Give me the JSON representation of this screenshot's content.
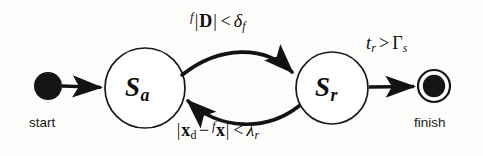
{
  "diagram": {
    "type": "finite-state-machine",
    "title": "",
    "stroke_color": "#131212",
    "fill_color": "#ffffff",
    "background": "#fdfdfc",
    "nodes": [
      {
        "id": "start",
        "kind": "initial-node",
        "label": "start",
        "symbol": "",
        "cx": 48,
        "cy": 86,
        "r": 14
      },
      {
        "id": "s_a",
        "kind": "state",
        "label": "",
        "symbol_base": "S",
        "symbol_sub": "a",
        "cx": 145,
        "cy": 88,
        "r": 40
      },
      {
        "id": "s_r",
        "kind": "state",
        "label": "",
        "symbol_base": "S",
        "symbol_sub": "r",
        "cx": 332,
        "cy": 88,
        "r": 36
      },
      {
        "id": "finish",
        "kind": "final-node",
        "label": "finish",
        "symbol": "",
        "cx": 434,
        "cy": 86,
        "r": 16
      }
    ],
    "edges": [
      {
        "id": "start-to-sa",
        "from": "start",
        "to": "s_a",
        "shape": "straight",
        "label": ""
      },
      {
        "id": "sa-to-sr",
        "from": "s_a",
        "to": "s_r",
        "shape": "arc-upper",
        "label_plain": "f|D| < delta_f"
      },
      {
        "id": "sr-to-sa",
        "from": "s_r",
        "to": "s_a",
        "shape": "arc-lower",
        "label_plain": "|x_d - f x| < lambda_r"
      },
      {
        "id": "sr-to-finish",
        "from": "s_r",
        "to": "finish",
        "shape": "straight",
        "label_plain": "t_r > Gamma_s"
      }
    ]
  },
  "labels": {
    "start_text": "start",
    "finish_text": "finish",
    "state_a": {
      "base": "S",
      "sub": "a"
    },
    "state_r": {
      "base": "S",
      "sub": "r"
    },
    "transition_top": {
      "leading_superscript": "f",
      "open_bar": "|",
      "vector": "D",
      "close_bar": "|",
      "relation": "<",
      "bound_base": "δ",
      "bound_sub": "f",
      "plain": "ᶠ|D| < δf"
    },
    "transition_bottom": {
      "open_bar": "|",
      "vector_1": "x",
      "vector_1_sub": "d",
      "operator": "−",
      "leading_superscript": "f",
      "vector_2": "x",
      "close_bar": "|",
      "relation": "<",
      "bound_base": "λ",
      "bound_sub": "r",
      "plain": "|xd − ᶠx| < λᵣ"
    },
    "transition_right": {
      "variable_base": "t",
      "variable_sub": "r",
      "relation": ">",
      "bound_base": "Γ",
      "bound_sub": "s",
      "plain": "tᵣ > Γₛ"
    }
  }
}
